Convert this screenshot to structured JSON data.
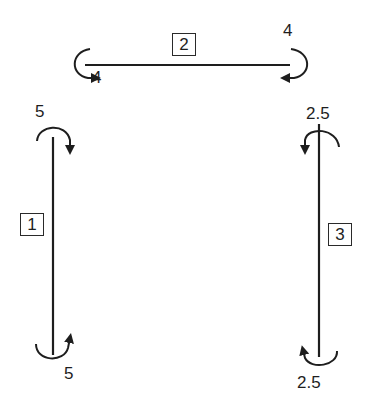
{
  "diagram": {
    "stroke_color": "#1e1e1e",
    "members": [
      {
        "id": "1",
        "orientation": "vertical",
        "end_moments": {
          "top": "5",
          "bottom": "5"
        }
      },
      {
        "id": "2",
        "orientation": "horizontal",
        "end_moments": {
          "left": "4",
          "right": "4"
        }
      },
      {
        "id": "3",
        "orientation": "vertical",
        "end_moments": {
          "top": "2.5",
          "bottom": "2.5"
        }
      }
    ]
  }
}
